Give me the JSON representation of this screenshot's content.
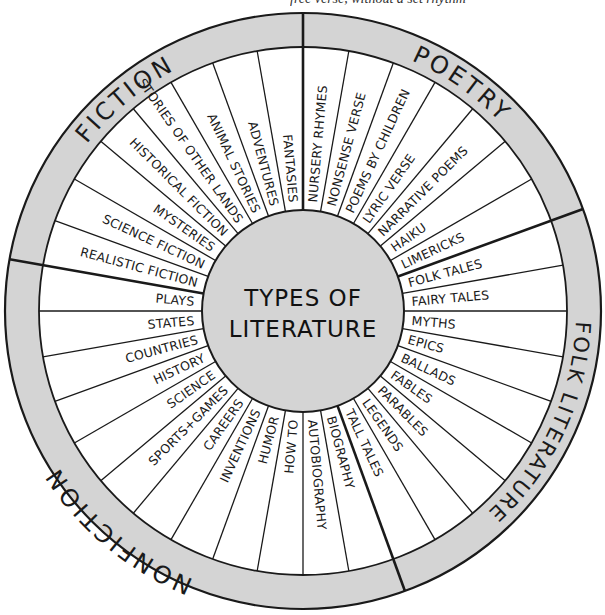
{
  "caption": {
    "partial_text": "free verse, without a set rhythm"
  },
  "center": {
    "title_line1": "TYPES OF",
    "title_line2": "LITERATURE"
  },
  "colors": {
    "ring": "#d4d4d4",
    "center": "#d4d4d4",
    "line": "#1a1a1a",
    "slice": "#ffffff"
  },
  "categories": [
    {
      "name": "FICTION",
      "start_deg": 170,
      "end_deg": 90,
      "items": [
        "REALISTIC FICTION",
        "SCIENCE FICTION",
        "MYSTERIES",
        "HISTORICAL FICTION",
        "STORIES OF OTHER LANDS",
        "ANIMAL STORIES",
        "ADVENTURES",
        "FANTASIES"
      ]
    },
    {
      "name": "POETRY",
      "start_deg": 90,
      "end_deg": 20,
      "items": [
        "NURSERY RHYMES",
        "NONSENSE VERSE",
        "POEMS BY CHILDREN",
        "LYRIC VERSE",
        "NARRATIVE POEMS",
        "HAIKU",
        "LIMERICKS"
      ]
    },
    {
      "name": "FOLK LITERATURE",
      "start_deg": 20,
      "end_deg": -70,
      "items": [
        "FOLK TALES",
        "FAIRY TALES",
        "MYTHS",
        "EPICS",
        "BALLADS",
        "FABLES",
        "PARABLES",
        "LEGENDS",
        "TALL TALES"
      ]
    },
    {
      "name": "NONFICTION",
      "start_deg": -70,
      "end_deg": -190,
      "items": [
        "BIOGRAPHY",
        "AUTOBIOGRAPHY",
        "HOW TO",
        "HUMOR",
        "INVENTIONS",
        "CAREERS",
        "SPORTS+GAMES",
        "SCIENCE",
        "HISTORY",
        "COUNTRIES",
        "STATES",
        "PLAYS"
      ]
    }
  ]
}
